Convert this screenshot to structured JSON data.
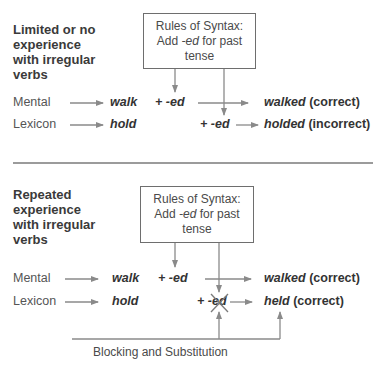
{
  "panels": [
    {
      "heading": [
        "Limited or no",
        "experience",
        "with irregular",
        "verbs"
      ],
      "box": {
        "line1": "Rules of Syntax:",
        "line2_pre": "Add ",
        "line2_em": "-ed",
        "line2_post": " for past",
        "line3": "tense"
      },
      "rows": [
        {
          "label": "Mental",
          "word": "walk",
          "suffix": "+ -ed",
          "result_word": "walked",
          "result_note": " (correct)"
        },
        {
          "label": "Lexicon",
          "word": "hold",
          "suffix": "+ -ed",
          "result_word": "holded",
          "result_note": " (incorrect)"
        }
      ]
    },
    {
      "heading": [
        "Repeated",
        "experience",
        "with irregular",
        "verbs"
      ],
      "box": {
        "line1": "Rules of Syntax:",
        "line2_pre": "Add ",
        "line2_em": "-ed",
        "line2_post": " for past",
        "line3": "tense"
      },
      "rows": [
        {
          "label": "Mental",
          "word": "walk",
          "suffix": "+ -ed",
          "result_word": "walked",
          "result_note": " (correct)"
        },
        {
          "label": "Lexicon",
          "word": "hold",
          "suffix": "+ -ed",
          "result_word": "held",
          "result_note": " (correct)"
        }
      ],
      "feedback_label": "Blocking and Substitution"
    }
  ],
  "colors": {
    "line": "#8a8a8a",
    "divider": "#7a7a7a",
    "box_border": "#6e6e6e"
  }
}
